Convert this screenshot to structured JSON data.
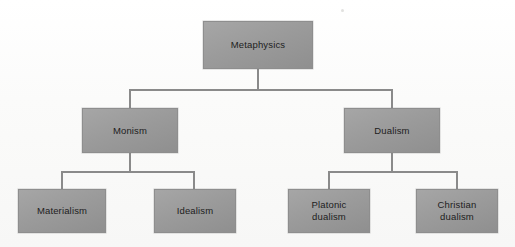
{
  "diagram": {
    "type": "hierarchy-tree",
    "background_color": "#fdfdfc",
    "node_fill_color": "#9b9b9b",
    "node_border_color": "#8e8e8e",
    "connector_color": "#8a8a8a",
    "text_color": "#1d1d1d",
    "levels": 3,
    "nodes": [
      {
        "id": "metaphysics",
        "label": "Metaphysics",
        "level": 0,
        "x": 203,
        "y": 21,
        "w": 110,
        "h": 48,
        "parent": null
      },
      {
        "id": "monism",
        "label": "Monism",
        "level": 1,
        "x": 82,
        "y": 108,
        "w": 96,
        "h": 45,
        "parent": "metaphysics"
      },
      {
        "id": "dualism",
        "label": "Dualism",
        "level": 1,
        "x": 344,
        "y": 108,
        "w": 96,
        "h": 45,
        "parent": "metaphysics"
      },
      {
        "id": "materialism",
        "label": "Materialism",
        "level": 2,
        "x": 18,
        "y": 189,
        "w": 88,
        "h": 44,
        "parent": "monism"
      },
      {
        "id": "idealism",
        "label": "Idealism",
        "level": 2,
        "x": 154,
        "y": 189,
        "w": 82,
        "h": 44,
        "parent": "monism"
      },
      {
        "id": "platonic-dualism",
        "label": "Platonic\ndualism",
        "level": 2,
        "x": 288,
        "y": 189,
        "w": 82,
        "h": 44,
        "parent": "dualism"
      },
      {
        "id": "christian-dualism",
        "label": "Christian\ndualism",
        "level": 2,
        "x": 416,
        "y": 189,
        "w": 82,
        "h": 44,
        "parent": "dualism"
      }
    ],
    "edges": [
      {
        "from": "metaphysics",
        "to": "monism"
      },
      {
        "from": "metaphysics",
        "to": "dualism"
      },
      {
        "from": "monism",
        "to": "materialism"
      },
      {
        "from": "monism",
        "to": "idealism"
      },
      {
        "from": "dualism",
        "to": "platonic-dualism"
      },
      {
        "from": "dualism",
        "to": "christian-dualism"
      }
    ]
  }
}
